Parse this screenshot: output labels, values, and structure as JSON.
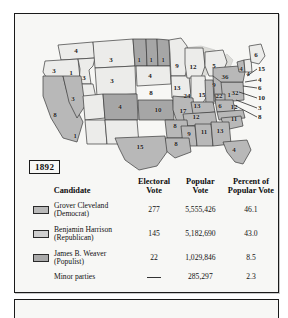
{
  "figure": {
    "year_label": "1892",
    "panel_bg": "#f7f7f5",
    "border_color": "#1a1a1a"
  },
  "map": {
    "title": "Electoral map of the United States, election of 1892",
    "state_votes": [
      {
        "id": "WA",
        "label": "4",
        "x": 61,
        "y": 37
      },
      {
        "id": "OR",
        "label": "3",
        "x": 39,
        "y": 57
      },
      {
        "id": "ID-N",
        "label": "1",
        "x": 56,
        "y": 58
      },
      {
        "id": "MT",
        "label": "3",
        "x": 96,
        "y": 46
      },
      {
        "id": "ND",
        "label": "1",
        "x": 122,
        "y": 45
      },
      {
        "id": "SD",
        "label": "1",
        "x": 135,
        "y": 45
      },
      {
        "id": "SD-E",
        "label": "1",
        "x": 147,
        "y": 45
      },
      {
        "id": "MN",
        "label": "9",
        "x": 161,
        "y": 52
      },
      {
        "id": "ID",
        "label": "3",
        "x": 68,
        "y": 65
      },
      {
        "id": "WY",
        "label": "3",
        "x": 97,
        "y": 68
      },
      {
        "id": "NE",
        "label": "4",
        "x": 133,
        "y": 62
      },
      {
        "id": "IA",
        "label": "8",
        "x": 136,
        "y": 80
      },
      {
        "id": "WI",
        "label": "12",
        "x": 177,
        "y": 55
      },
      {
        "id": "MI",
        "label": "5",
        "x": 197,
        "y": 55
      },
      {
        "id": "IL",
        "label": "13",
        "x": 161,
        "y": 74
      },
      {
        "id": "NV",
        "label": "3",
        "x": 58,
        "y": 85
      },
      {
        "id": "CA",
        "label": "8",
        "x": 40,
        "y": 101
      },
      {
        "id": "CA-S",
        "label": "1",
        "x": 60,
        "y": 122
      },
      {
        "id": "CO",
        "label": "4",
        "x": 104,
        "y": 94
      },
      {
        "id": "KS",
        "label": "10",
        "x": 143,
        "y": 96
      },
      {
        "id": "MO",
        "label": "17",
        "x": 168,
        "y": 98
      },
      {
        "id": "IN",
        "label": "15",
        "x": 183,
        "y": 83
      },
      {
        "id": "OH",
        "label": "22",
        "x": 196,
        "y": 83
      },
      {
        "id": "IN2",
        "label": "24",
        "x": 170,
        "y": 83
      },
      {
        "id": "OH-N",
        "label": "9",
        "x": 196,
        "y": 71
      },
      {
        "id": "PA",
        "label": "32",
        "x": 216,
        "y": 79
      },
      {
        "id": "WV",
        "label": "1",
        "x": 205,
        "y": 80
      },
      {
        "id": "NY",
        "label": "36",
        "x": 209,
        "y": 64
      },
      {
        "id": "VT",
        "label": "4",
        "x": 226,
        "y": 55
      },
      {
        "id": "NH",
        "label": "4",
        "x": 233,
        "y": 58
      },
      {
        "id": "ME",
        "label": "6",
        "x": 240,
        "y": 42
      },
      {
        "id": "KY",
        "label": "13",
        "x": 181,
        "y": 92
      },
      {
        "id": "VA",
        "label": "6",
        "x": 203,
        "y": 93
      },
      {
        "id": "NC",
        "label": "12",
        "x": 217,
        "y": 93
      },
      {
        "id": "TN",
        "label": "12",
        "x": 180,
        "y": 103
      },
      {
        "id": "SC",
        "label": "11",
        "x": 218,
        "y": 104
      },
      {
        "id": "AR",
        "label": "8",
        "x": 160,
        "y": 112
      },
      {
        "id": "GA",
        "label": "13",
        "x": 203,
        "y": 115
      },
      {
        "id": "AL",
        "label": "11",
        "x": 188,
        "y": 116
      },
      {
        "id": "MS",
        "label": "9",
        "x": 173,
        "y": 118
      },
      {
        "id": "LA",
        "label": "8",
        "x": 161,
        "y": 129
      },
      {
        "id": "FL",
        "label": "4",
        "x": 218,
        "y": 135
      },
      {
        "id": "TX",
        "label": "15",
        "x": 124,
        "y": 133
      }
    ],
    "callouts": [
      {
        "label": "15",
        "x": 244,
        "y": 55,
        "lx1": 232,
        "ly1": 62,
        "lx2": 242,
        "ly2": 55
      },
      {
        "label": "4",
        "x": 244,
        "y": 66,
        "lx1": 230,
        "ly1": 68,
        "lx2": 242,
        "ly2": 66
      },
      {
        "label": "6",
        "x": 244,
        "y": 74,
        "lx1": 228,
        "ly1": 72,
        "lx2": 242,
        "ly2": 74
      },
      {
        "label": "10",
        "x": 244,
        "y": 84,
        "lx1": 224,
        "ly1": 78,
        "lx2": 242,
        "ly2": 84
      },
      {
        "label": "3",
        "x": 244,
        "y": 94,
        "lx1": 221,
        "ly1": 86,
        "lx2": 242,
        "ly2": 94
      },
      {
        "label": "8",
        "x": 244,
        "y": 103,
        "lx1": 219,
        "ly1": 91,
        "lx2": 242,
        "ly2": 103
      }
    ]
  },
  "table": {
    "headers": {
      "candidate": "Candidate",
      "electoral_vote_l1": "Electoral",
      "electoral_vote_l2": "Vote",
      "popular_vote_l1": "Popular",
      "popular_vote_l2": "Vote",
      "percent_l1": "Percent of",
      "percent_l2": "Popular Vote"
    },
    "rows": [
      {
        "name_line1": "Grover Cleveland",
        "name_line2": "(Democrat)",
        "electoral_vote": "277",
        "popular_vote": "5,555,426",
        "percent": "46.1",
        "swatch": "sw-cleveland"
      },
      {
        "name_line1": "Benjamin Harrison",
        "name_line2": "(Republican)",
        "electoral_vote": "145",
        "popular_vote": "5,182,690",
        "percent": "43.0",
        "swatch": "sw-harrison"
      },
      {
        "name_line1": "James B. Weaver",
        "name_line2": "(Populist)",
        "electoral_vote": "22",
        "popular_vote": "1,029,846",
        "percent": "8.5",
        "swatch": "sw-weaver"
      }
    ],
    "minor": {
      "label": "Minor parties",
      "electoral_vote": "—",
      "popular_vote": "285,297",
      "percent": "2.3"
    }
  },
  "colors": {
    "cleveland_fill": "#b9b9b9",
    "harrison_fill": "#e9e9e6",
    "weaver_fill": "#a9a9a9",
    "outline": "#3a3a3a",
    "panel": "#f7f7f5"
  }
}
